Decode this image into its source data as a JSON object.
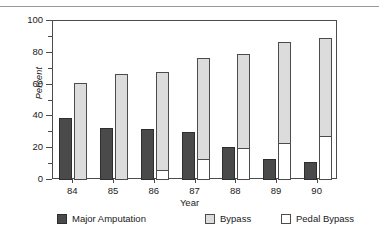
{
  "chart_data": {
    "type": "bar",
    "title": "",
    "xlabel": "Year",
    "ylabel": "Percent",
    "categories": [
      "84",
      "85",
      "86",
      "87",
      "88",
      "89",
      "90"
    ],
    "ylim": [
      0,
      100
    ],
    "yticks": [
      0,
      20,
      40,
      60,
      80,
      100
    ],
    "yticks_minor": [
      10,
      30,
      50,
      70,
      90
    ],
    "grid": false,
    "legend_position": "bottom",
    "stacked_group": "Bypass bar is stacked: Pedal Bypass at base, remainder Bypass",
    "series": [
      {
        "name": "Major Amputation",
        "color": "#4a4a4a",
        "values": [
          39,
          33,
          32,
          30,
          21,
          13.5,
          11.5
        ]
      },
      {
        "name": "Bypass",
        "color": "#dcdcdc",
        "values": [
          61,
          66.5,
          68,
          77,
          79,
          87,
          89
        ]
      },
      {
        "name": "Pedal Bypass",
        "color": "#ffffff",
        "values": [
          0,
          0,
          6,
          13,
          20,
          23,
          27.5
        ]
      }
    ]
  },
  "axis": {
    "ylabel": "Percent",
    "xlabel": "Year",
    "ytick_labels": [
      "0",
      "20",
      "40",
      "60",
      "80",
      "100"
    ],
    "xtick_labels": [
      "84",
      "85",
      "86",
      "87",
      "88",
      "89",
      "90"
    ]
  },
  "legend": {
    "items": [
      {
        "label": "Major Amputation",
        "color": "#4a4a4a"
      },
      {
        "label": "Bypass",
        "color": "#dcdcdc"
      },
      {
        "label": "Pedal Bypass",
        "color": "#ffffff"
      }
    ]
  },
  "colors": {
    "amputation": "#4a4a4a",
    "bypass": "#dcdcdc",
    "pedal": "#ffffff",
    "axis": "#4c4c4c",
    "rule": "#9a9a9a"
  }
}
